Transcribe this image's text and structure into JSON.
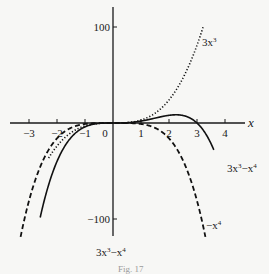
{
  "chart_data": {
    "type": "line",
    "title": "",
    "xlabel": "x",
    "ylabel": "",
    "xlim": [
      -3.3,
      4.6
    ],
    "ylim": [
      -120,
      110
    ],
    "grid": false,
    "x_ticks": [
      -3,
      -2,
      -1,
      0,
      1,
      2,
      3,
      4
    ],
    "x_tick_labels": [
      "−3",
      "−2",
      "−1",
      "0",
      "1",
      "2",
      "3",
      "4"
    ],
    "y_ticks": [
      100,
      -100
    ],
    "y_tick_labels": [
      "100",
      "−100"
    ],
    "series": [
      {
        "name": "3x³",
        "label": "3x³",
        "style": "dotted",
        "formula": "3*x^3",
        "x_range": [
          -2.3,
          3.22
        ]
      },
      {
        "name": "−x⁴",
        "label": "−x⁴",
        "style": "dashed",
        "formula": "-x^4",
        "x_range": [
          -3.3,
          3.3
        ]
      },
      {
        "name": "3x³−x⁴",
        "label": "3x³−x⁴",
        "style": "solid",
        "formula": "3*x^3 - x^4",
        "x_range": [
          -2.6,
          3.6
        ]
      }
    ],
    "annotations": [
      "3x³−x⁴"
    ],
    "caption": "Fig. 17"
  }
}
